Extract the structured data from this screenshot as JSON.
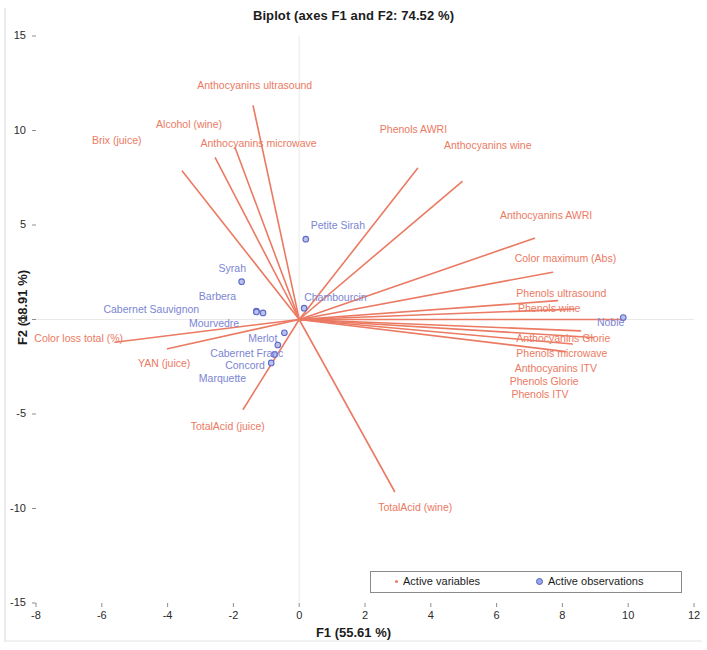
{
  "chart_data": {
    "type": "scatter",
    "title": "Biplot (axes F1 and F2: 74.52 %)",
    "xlabel": "F1 (55.61 %)",
    "ylabel": "F2 (18.91 %)",
    "xlim": [
      -8,
      12
    ],
    "ylim": [
      -15,
      15
    ],
    "xticks": [
      -8,
      -6,
      -4,
      -2,
      0,
      2,
      4,
      6,
      8,
      10,
      12
    ],
    "yticks": [
      -15,
      -10,
      -5,
      0,
      5,
      10,
      15
    ],
    "grid": false,
    "legend_position": "bottom-right",
    "legend": [
      {
        "label": "Active variables",
        "color": "#eb7a63",
        "marker": "dot-small"
      },
      {
        "label": "Active observations",
        "color": "#7b85d4",
        "marker": "circle"
      }
    ],
    "variable_color": "#eb7a63",
    "observation_color": "#7b85d4",
    "variables": [
      {
        "name": "Anthocyanins ultrasound",
        "x": -1.4,
        "y": 11.3,
        "label_x": -3.1,
        "label_y": 12.35
      },
      {
        "name": "Alcohol (wine)",
        "x": -2.55,
        "y": 8.55,
        "label_x": -4.35,
        "label_y": 10.3
      },
      {
        "name": "Brix (juice)",
        "x": -3.55,
        "y": 7.85,
        "label_x": -6.3,
        "label_y": 9.45
      },
      {
        "name": "Anthocyanins microwave",
        "x": -1.95,
        "y": 9.1,
        "label_x": -3.0,
        "label_y": 9.3
      },
      {
        "name": "Phenols AWRI",
        "x": 3.6,
        "y": 8.0,
        "label_x": 2.45,
        "label_y": 10.05
      },
      {
        "name": "Anthocyanins wine",
        "x": 4.95,
        "y": 7.3,
        "label_x": 4.4,
        "label_y": 9.2
      },
      {
        "name": "Anthocyanins AWRI",
        "x": 7.15,
        "y": 4.3,
        "label_x": 6.1,
        "label_y": 5.45
      },
      {
        "name": "Color maximum (Abs)",
        "x": 7.7,
        "y": 2.5,
        "label_x": 6.55,
        "label_y": 3.2
      },
      {
        "name": "Phenols ultrasound",
        "x": 7.85,
        "y": 1.0,
        "label_x": 6.6,
        "label_y": 1.35
      },
      {
        "name": "Phenols wine",
        "x": 8.35,
        "y": 0.55,
        "label_x": 6.65,
        "label_y": 0.55
      },
      {
        "name": "Anthocyanins Glorie",
        "x": 9.9,
        "y": 0.0,
        "label_x": 6.6,
        "label_y": -1.05
      },
      {
        "name": "Phenols microwave",
        "x": 8.55,
        "y": -0.6,
        "label_x": 6.6,
        "label_y": -1.85
      },
      {
        "name": "Anthocyanins ITV",
        "x": 8.95,
        "y": -0.95,
        "label_x": 6.55,
        "label_y": -2.6
      },
      {
        "name": "Phenols Glorie",
        "x": 8.3,
        "y": -1.3,
        "label_x": 6.4,
        "label_y": -3.3
      },
      {
        "name": "Phenols ITV",
        "x": 8.1,
        "y": -1.7,
        "label_x": 6.45,
        "label_y": -4.0
      },
      {
        "name": "Color loss total (%)",
        "x": -5.6,
        "y": -1.2,
        "label_x": -8.05,
        "label_y": -1.05
      },
      {
        "name": "YAN (juice)",
        "x": -4.0,
        "y": -1.55,
        "label_x": -4.9,
        "label_y": -2.35
      },
      {
        "name": "TotalAcid (juice)",
        "x": -1.7,
        "y": -4.75,
        "label_x": -3.3,
        "label_y": -5.7
      },
      {
        "name": "TotalAcid (wine)",
        "x": 2.9,
        "y": -9.1,
        "label_x": 2.4,
        "label_y": -9.95
      }
    ],
    "observations": [
      {
        "name": "Petite Sirah",
        "x": 0.2,
        "y": 4.25,
        "label_x": 0.35,
        "label_y": 4.95
      },
      {
        "name": "Syrah",
        "x": -1.75,
        "y": 2.0,
        "label_x": -2.45,
        "label_y": 2.65
      },
      {
        "name": "Barbera",
        "x": -1.3,
        "y": 0.45,
        "label_x": -3.05,
        "label_y": 1.2
      },
      {
        "name": "Cabernet Sauvignon",
        "x": -1.3,
        "y": 0.4,
        "label_x": -5.95,
        "label_y": 0.5
      },
      {
        "name": "Mourvedre",
        "x": -1.1,
        "y": 0.35,
        "label_x": -3.35,
        "label_y": -0.25
      },
      {
        "name": "Chambourcin",
        "x": 0.15,
        "y": 0.6,
        "label_x": 0.15,
        "label_y": 1.15
      },
      {
        "name": "Merlot",
        "x": -0.45,
        "y": -0.7,
        "label_x": -1.55,
        "label_y": -1.05
      },
      {
        "name": "Cabernet Franc",
        "x": -0.65,
        "y": -1.35,
        "label_x": -2.7,
        "label_y": -1.8
      },
      {
        "name": "Concord",
        "x": -0.75,
        "y": -1.85,
        "label_x": -2.25,
        "label_y": -2.45
      },
      {
        "name": "Marquette",
        "x": -0.85,
        "y": -2.3,
        "label_x": -3.05,
        "label_y": -3.15
      },
      {
        "name": "Noble",
        "x": 9.85,
        "y": 0.1,
        "label_x": 9.05,
        "label_y": -0.2
      }
    ]
  }
}
